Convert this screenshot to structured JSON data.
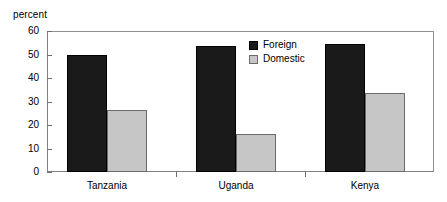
{
  "chart_data": {
    "type": "bar",
    "title": "",
    "subtitle": "",
    "xlabel": "",
    "ylabel": "percent",
    "ylim": [
      0,
      60
    ],
    "yticks": [
      0,
      10,
      20,
      30,
      40,
      50,
      60
    ],
    "ytick_labels": [
      "0",
      "10",
      "20",
      "30",
      "40",
      "50",
      "60"
    ],
    "grid": false,
    "legend_position": "top-right-inside",
    "categories": [
      "Tanzania",
      "Uganda",
      "Kenya"
    ],
    "series": [
      {
        "name": "Foreign",
        "color": "#1a1a1a",
        "values": [
          50,
          53.5,
          54.5
        ]
      },
      {
        "name": "Domestic",
        "color": "#c6c6c6",
        "values": [
          26.5,
          16,
          33.5
        ]
      }
    ]
  },
  "axis": {
    "y_label": "percent"
  },
  "legend": {
    "entries": [
      {
        "label": "Foreign"
      },
      {
        "label": "Domestic"
      }
    ]
  }
}
